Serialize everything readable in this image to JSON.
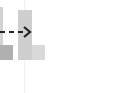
{
  "diagram": {
    "colors": {
      "left_stem": "#d2d2d2",
      "left_base": "#b0b0b0",
      "right_stem": "#cfcfcf",
      "right_foot": "#d9d9d9",
      "arrow": "#222222",
      "guide_line": "#f1f1f1"
    },
    "shapes": [
      {
        "id": "left-l-shape",
        "kind": "L-block",
        "state": "source"
      },
      {
        "id": "right-l-shape",
        "kind": "L-block",
        "state": "target"
      }
    ],
    "connector": {
      "id": "transform-arrow",
      "style": "dashed",
      "direction": "right"
    }
  }
}
